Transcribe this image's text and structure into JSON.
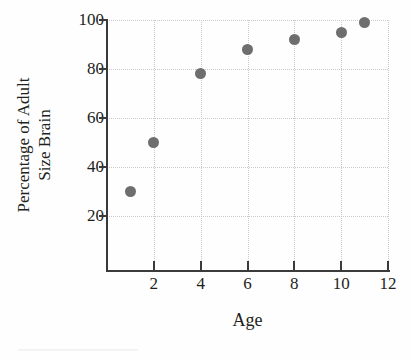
{
  "chart_data": {
    "type": "scatter",
    "title": "",
    "xlabel": "Age",
    "ylabel": "Percentage of Adult Size Brain",
    "ylabel_lines": [
      "Percentage of Adult",
      "Size Brain"
    ],
    "x": [
      1,
      2,
      4,
      6,
      8,
      10,
      11
    ],
    "values": [
      30,
      50,
      78,
      88,
      92,
      95,
      99
    ],
    "points": [
      {
        "x": 1,
        "y": 30
      },
      {
        "x": 2,
        "y": 50
      },
      {
        "x": 4,
        "y": 78
      },
      {
        "x": 6,
        "y": 88
      },
      {
        "x": 8,
        "y": 92
      },
      {
        "x": 10,
        "y": 95
      },
      {
        "x": 11,
        "y": 99
      }
    ],
    "xlim": [
      0,
      12
    ],
    "ylim": [
      0,
      100
    ],
    "xticks": [
      2,
      4,
      6,
      8,
      10,
      12
    ],
    "xtick_labels": [
      "2",
      "4",
      "6",
      "8",
      "10",
      "12"
    ],
    "yticks": [
      20,
      40,
      60,
      80,
      100
    ],
    "ytick_labels": [
      "20",
      "40",
      "60",
      "80",
      "100"
    ],
    "grid": true,
    "legend": null,
    "marker_color": "#6e6e6e",
    "grid_color": "#c9c9c9",
    "axis_color": "#3a3a3a",
    "background": "#ffffff"
  }
}
